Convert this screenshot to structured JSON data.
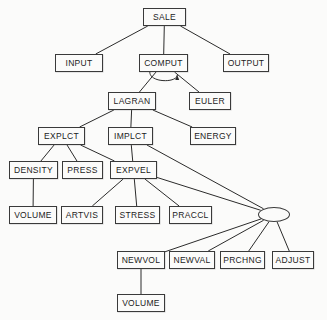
{
  "diagram": {
    "type": "tree",
    "canvas": {
      "width": 327,
      "height": 320
    },
    "style": {
      "background": "#fbfbfa",
      "node_fill": "#fbfbfa",
      "node_stroke": "#3a3a3a",
      "edge_stroke": "#2b2b2b",
      "text_color": "#1c1c1c"
    },
    "nodes": [
      {
        "id": "sale",
        "label": "SALE",
        "shape": "rect",
        "x": 143,
        "y": 8,
        "w": 43,
        "h": 18
      },
      {
        "id": "input",
        "label": "INPUT",
        "shape": "rect",
        "x": 55,
        "y": 54,
        "w": 48,
        "h": 18
      },
      {
        "id": "comput",
        "label": "COMPUT",
        "shape": "rect",
        "x": 139,
        "y": 54,
        "w": 49,
        "h": 18
      },
      {
        "id": "output",
        "label": "OUTPUT",
        "shape": "rect",
        "x": 223,
        "y": 54,
        "w": 46,
        "h": 18
      },
      {
        "id": "lagran",
        "label": "LAGRAN",
        "shape": "rect",
        "x": 108,
        "y": 92,
        "w": 48,
        "h": 18
      },
      {
        "id": "euler",
        "label": "EULER",
        "shape": "rect",
        "x": 189,
        "y": 92,
        "w": 42,
        "h": 18
      },
      {
        "id": "explct",
        "label": "EXPLCT",
        "shape": "rect",
        "x": 38,
        "y": 127,
        "w": 47,
        "h": 18
      },
      {
        "id": "implct",
        "label": "IMPLCT",
        "shape": "rect",
        "x": 108,
        "y": 127,
        "w": 45,
        "h": 18
      },
      {
        "id": "energy",
        "label": "ENERGY",
        "shape": "rect",
        "x": 190,
        "y": 127,
        "w": 46,
        "h": 18
      },
      {
        "id": "density",
        "label": "DENSITY",
        "shape": "rect",
        "x": 9,
        "y": 161,
        "w": 49,
        "h": 18
      },
      {
        "id": "press",
        "label": "PRESS",
        "shape": "rect",
        "x": 62,
        "y": 161,
        "w": 41,
        "h": 18
      },
      {
        "id": "expvel",
        "label": "EXPVEL",
        "shape": "rect",
        "x": 110,
        "y": 161,
        "w": 47,
        "h": 18
      },
      {
        "id": "volume1",
        "label": "VOLUME",
        "shape": "rect",
        "x": 9,
        "y": 206,
        "w": 48,
        "h": 18
      },
      {
        "id": "artvis",
        "label": "ARTVIS",
        "shape": "rect",
        "x": 61,
        "y": 206,
        "w": 42,
        "h": 18
      },
      {
        "id": "stress",
        "label": "STRESS",
        "shape": "rect",
        "x": 115,
        "y": 206,
        "w": 45,
        "h": 18
      },
      {
        "id": "praccl",
        "label": "PRACCL",
        "shape": "rect",
        "x": 169,
        "y": 206,
        "w": 43,
        "h": 18
      },
      {
        "id": "junction",
        "label": "",
        "shape": "ellipse",
        "x": 258,
        "y": 207,
        "w": 32,
        "h": 15
      },
      {
        "id": "newvol",
        "label": "NEWVOL",
        "shape": "rect",
        "x": 117,
        "y": 251,
        "w": 48,
        "h": 18
      },
      {
        "id": "newval",
        "label": "NEWVAL",
        "shape": "rect",
        "x": 169,
        "y": 251,
        "w": 46,
        "h": 18
      },
      {
        "id": "prchng",
        "label": "PRCHNG",
        "shape": "rect",
        "x": 220,
        "y": 251,
        "w": 45,
        "h": 18
      },
      {
        "id": "adjust",
        "label": "ADJUST",
        "shape": "rect",
        "x": 272,
        "y": 251,
        "w": 42,
        "h": 18
      },
      {
        "id": "volume2",
        "label": "VOLUME",
        "shape": "rect",
        "x": 117,
        "y": 294,
        "w": 48,
        "h": 18
      }
    ],
    "edges": [
      {
        "from": "sale",
        "to": "input"
      },
      {
        "from": "sale",
        "to": "comput"
      },
      {
        "from": "sale",
        "to": "output"
      },
      {
        "from": "comput",
        "to": "lagran"
      },
      {
        "from": "comput",
        "to": "euler"
      },
      {
        "from": "comput",
        "to": "comput",
        "kind": "self-loop-arrow"
      },
      {
        "from": "lagran",
        "to": "explct"
      },
      {
        "from": "lagran",
        "to": "implct"
      },
      {
        "from": "lagran",
        "to": "energy"
      },
      {
        "from": "explct",
        "to": "density"
      },
      {
        "from": "explct",
        "to": "press"
      },
      {
        "from": "explct",
        "to": "expvel"
      },
      {
        "from": "implct",
        "to": "expvel"
      },
      {
        "from": "implct",
        "to": "junction"
      },
      {
        "from": "density",
        "to": "volume1"
      },
      {
        "from": "expvel",
        "to": "artvis"
      },
      {
        "from": "expvel",
        "to": "stress"
      },
      {
        "from": "expvel",
        "to": "praccl"
      },
      {
        "from": "expvel",
        "to": "junction"
      },
      {
        "from": "junction",
        "to": "newvol"
      },
      {
        "from": "junction",
        "to": "newval"
      },
      {
        "from": "junction",
        "to": "prchng"
      },
      {
        "from": "junction",
        "to": "adjust"
      },
      {
        "from": "newvol",
        "to": "volume2"
      }
    ]
  }
}
